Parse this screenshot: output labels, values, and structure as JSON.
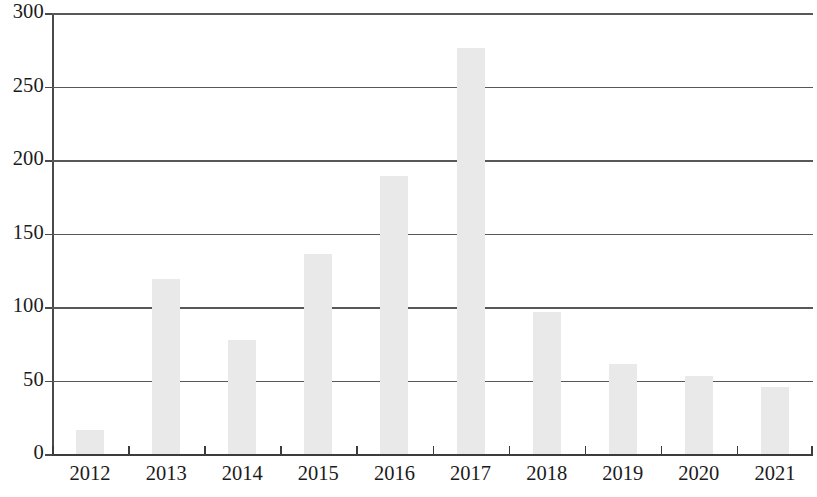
{
  "chart_data": {
    "type": "bar",
    "title": "",
    "subtitle": "",
    "xlabel": "",
    "ylabel": "",
    "categories": [
      "2012",
      "2013",
      "2014",
      "2015",
      "2016",
      "2017",
      "2018",
      "2019",
      "2020",
      "2021"
    ],
    "values": [
      17,
      120,
      78,
      137,
      190,
      277,
      97,
      62,
      54,
      46
    ],
    "series": [
      {
        "name": "",
        "values": [
          17,
          120,
          78,
          137,
          190,
          277,
          97,
          62,
          54,
          46
        ]
      }
    ],
    "ylim": [
      0,
      300
    ],
    "yticks": [
      0,
      50,
      100,
      150,
      200,
      250,
      300
    ],
    "ytick_labels": [
      "0",
      "50",
      "100",
      "150",
      "200",
      "250",
      "300"
    ],
    "grid": true,
    "grid_axis": "y",
    "legend": false,
    "legend_position": "none",
    "bar_color": "#e9e9e9",
    "axis_color": "#3c3c3c",
    "gridline_color": "#58585a",
    "text_color": "#1b1b1b",
    "background_color": "#ffffff"
  }
}
